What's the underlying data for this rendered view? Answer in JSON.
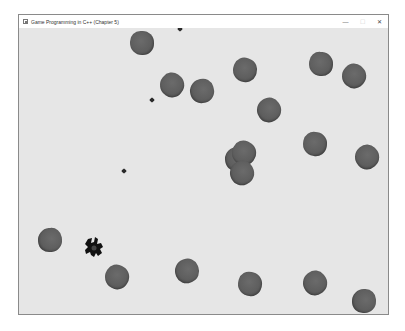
{
  "window": {
    "title": "Game Programming in C++ (Chapter 5)",
    "controls": {
      "minimize": "—",
      "maximize": "☐",
      "close": "✕"
    }
  },
  "game": {
    "background_color": "#e6e6e6",
    "asteroid_color": "#5f5f5f",
    "ship_color": "#111111",
    "asteroids": [
      {
        "x": 123,
        "y": 15
      },
      {
        "x": 153,
        "y": 57
      },
      {
        "x": 183,
        "y": 63
      },
      {
        "x": 226,
        "y": 42
      },
      {
        "x": 250,
        "y": 82
      },
      {
        "x": 302,
        "y": 36
      },
      {
        "x": 335,
        "y": 48
      },
      {
        "x": 218,
        "y": 131
      },
      {
        "x": 225,
        "y": 125
      },
      {
        "x": 223,
        "y": 145
      },
      {
        "x": 296,
        "y": 116
      },
      {
        "x": 348,
        "y": 129
      },
      {
        "x": 31,
        "y": 212
      },
      {
        "x": 98,
        "y": 249
      },
      {
        "x": 168,
        "y": 243
      },
      {
        "x": 231,
        "y": 256
      },
      {
        "x": 296,
        "y": 255
      },
      {
        "x": 345,
        "y": 273
      }
    ],
    "lasers": [
      {
        "x": 161,
        "y": 1
      },
      {
        "x": 133,
        "y": 72
      },
      {
        "x": 105,
        "y": 143
      }
    ],
    "ship": {
      "x": 75,
      "y": 219
    }
  }
}
